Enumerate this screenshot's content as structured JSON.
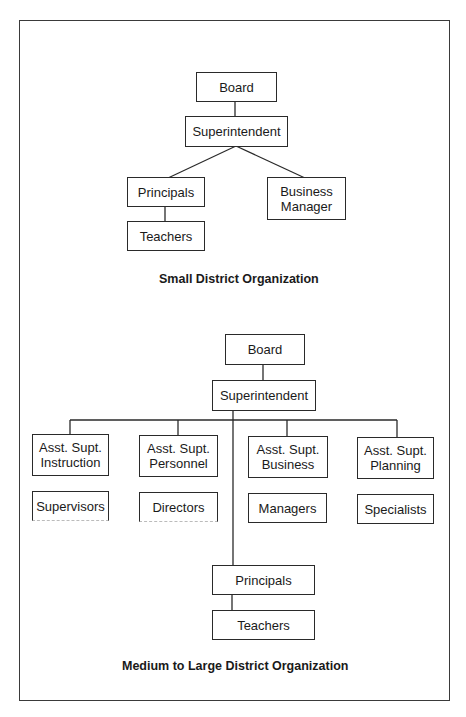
{
  "small_district": {
    "title": "Small District Organization",
    "nodes": {
      "board": "Board",
      "superintendent": "Superintendent",
      "principals": "Principals",
      "business_manager": "Business\nManager",
      "teachers": "Teachers"
    }
  },
  "large_district": {
    "title": "Medium to Large District Organization",
    "nodes": {
      "board": "Board",
      "superintendent": "Superintendent",
      "asst_instruction": "Asst. Supt.\nInstruction",
      "asst_personnel": "Asst. Supt.\nPersonnel",
      "asst_business": "Asst. Supt.\nBusiness",
      "asst_planning": "Asst. Supt.\nPlanning",
      "supervisors": "Supervisors",
      "directors": "Directors",
      "managers": "Managers",
      "specialists": "Specialists",
      "principals": "Principals",
      "teachers": "Teachers"
    }
  },
  "colors": {
    "line": "#2a2a2a",
    "background": "#ffffff",
    "text": "#1a1a1a"
  }
}
